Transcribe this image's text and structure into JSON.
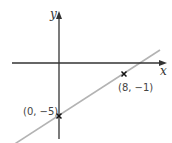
{
  "diagram": {
    "type": "coordinate-graph",
    "axes": {
      "x_label": "x",
      "y_label": "y",
      "axis_color": "#333333"
    },
    "line": {
      "color": "#b3b3b3",
      "description": "straight line with positive gradient passing through marked points"
    },
    "points": [
      {
        "label": "(0, −5)",
        "x": 0,
        "y": -5,
        "marker": "cross"
      },
      {
        "label": "(8, −1)",
        "x": 8,
        "y": -1,
        "marker": "cross"
      }
    ],
    "marker_color": "#111111"
  }
}
